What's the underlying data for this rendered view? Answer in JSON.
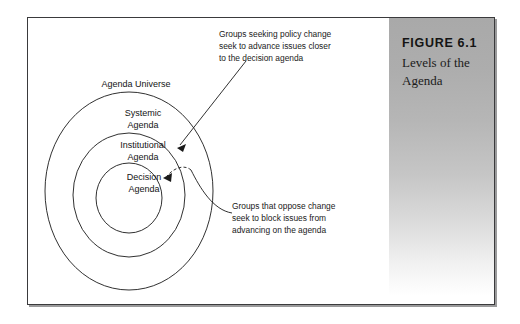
{
  "figure": {
    "number": "FIGURE 6.1",
    "caption": "Levels of the\nAgenda"
  },
  "diagram": {
    "type": "concentric-rings",
    "rings": [
      {
        "id": "agenda-universe",
        "label": "Agenda Universe",
        "level": 1
      },
      {
        "id": "systemic-agenda",
        "label": "Systemic\nAgenda",
        "level": 2
      },
      {
        "id": "institutional-agenda",
        "label": "Institutional\nAgenda",
        "level": 3
      },
      {
        "id": "decision-agenda",
        "label": "Decision\nAgenda",
        "level": 4
      }
    ],
    "annotations": [
      {
        "id": "advance",
        "text": "Groups seeking policy change\nseek to advance issues closer\nto the decision agenda",
        "points_to": "institutional-agenda"
      },
      {
        "id": "block",
        "text": "Groups that oppose change\nseek to block issues from\nadvancing on the agenda",
        "points_to": "decision-agenda"
      }
    ]
  },
  "colors": {
    "frame_border": "#3a3a3c",
    "panel_gradient_top": "#a9a9a9",
    "panel_gradient_bottom": "#ffffff",
    "line": "#1a1a1a",
    "text": "#141414",
    "page_background": "#ffffff"
  }
}
